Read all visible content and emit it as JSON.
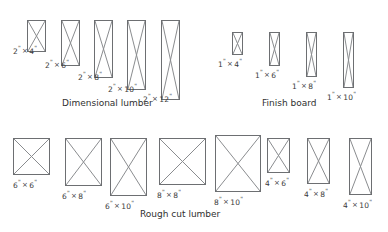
{
  "figure": {
    "background_color": "#ffffff",
    "stroke_color": "#6d6f72",
    "diagonal_color": "#8a8c8f",
    "text_color": "#3a3a3a"
  },
  "groups": [
    {
      "id": "dimensional-lumber",
      "caption": "Dimensional lumber",
      "caption_x": 62,
      "caption_y": 99,
      "items": [
        {
          "label": "2\" × 4\"",
          "nominal_width_in": 2,
          "nominal_height_in": 4,
          "shape": {
            "x": 27,
            "y": 20,
            "w": 19,
            "h": 32
          },
          "label_parts": {
            "first": "2",
            "second": "4"
          },
          "label_x": 13,
          "label_y": 45
        },
        {
          "label": "2\" × 6\"",
          "nominal_width_in": 2,
          "nominal_height_in": 6,
          "shape": {
            "x": 61,
            "y": 20,
            "w": 19,
            "h": 46
          },
          "label_parts": {
            "first": "2",
            "second": "6"
          },
          "label_x": 45,
          "label_y": 59
        },
        {
          "label": "2\" × 8\"",
          "nominal_width_in": 2,
          "nominal_height_in": 8,
          "shape": {
            "x": 94,
            "y": 20,
            "w": 19,
            "h": 58
          },
          "label_parts": {
            "first": "2",
            "second": "8"
          },
          "label_x": 78,
          "label_y": 71
        },
        {
          "label": "2\" × 10\"",
          "nominal_width_in": 2,
          "nominal_height_in": 10,
          "shape": {
            "x": 127,
            "y": 20,
            "w": 19,
            "h": 70
          },
          "label_parts": {
            "first": "2",
            "second": "10"
          },
          "label_x": 108,
          "label_y": 83
        },
        {
          "label": "2\" × 12\"",
          "nominal_width_in": 2,
          "nominal_height_in": 12,
          "shape": {
            "x": 161,
            "y": 20,
            "w": 19,
            "h": 80
          },
          "label_parts": {
            "first": "2",
            "second": "12"
          },
          "label_x": 143,
          "label_y": 93
        }
      ]
    },
    {
      "id": "finish-board",
      "caption": "Finish board",
      "caption_x": 262,
      "caption_y": 99,
      "items": [
        {
          "label": "1\" × 4\"",
          "nominal_width_in": 1,
          "nominal_height_in": 4,
          "shape": {
            "x": 232,
            "y": 32,
            "w": 11,
            "h": 23
          },
          "label_parts": {
            "first": "1",
            "second": "4"
          },
          "label_x": 218,
          "label_y": 58
        },
        {
          "label": "1\" × 6\"",
          "nominal_width_in": 1,
          "nominal_height_in": 6,
          "shape": {
            "x": 269,
            "y": 32,
            "w": 11,
            "h": 34
          },
          "label_parts": {
            "first": "1",
            "second": "6"
          },
          "label_x": 255,
          "label_y": 69
        },
        {
          "label": "1\" × 8\"",
          "nominal_width_in": 1,
          "nominal_height_in": 8,
          "shape": {
            "x": 306,
            "y": 32,
            "w": 11,
            "h": 45
          },
          "label_parts": {
            "first": "1",
            "second": "8"
          },
          "label_x": 292,
          "label_y": 80
        },
        {
          "label": "1\" × 10\"",
          "nominal_width_in": 1,
          "nominal_height_in": 10,
          "shape": {
            "x": 343,
            "y": 32,
            "w": 11,
            "h": 56
          },
          "label_parts": {
            "first": "1",
            "second": "10"
          },
          "label_x": 327,
          "label_y": 91
        }
      ]
    },
    {
      "id": "rough-cut-lumber",
      "caption": "Rough cut lumber",
      "caption_x": 140,
      "caption_y": 210,
      "items": [
        {
          "label": "6\" × 6\"",
          "nominal_width_in": 6,
          "nominal_height_in": 6,
          "shape": {
            "x": 13,
            "y": 138,
            "w": 37,
            "h": 37
          },
          "label_parts": {
            "first": "6",
            "second": "6"
          },
          "label_x": 13,
          "label_y": 179
        },
        {
          "label": "6\" × 8\"",
          "nominal_width_in": 6,
          "nominal_height_in": 8,
          "shape": {
            "x": 65,
            "y": 138,
            "w": 37,
            "h": 48
          },
          "label_parts": {
            "first": "6",
            "second": "8"
          },
          "label_x": 62,
          "label_y": 190
        },
        {
          "label": "6\" × 10\"",
          "nominal_width_in": 6,
          "nominal_height_in": 10,
          "shape": {
            "x": 110,
            "y": 138,
            "w": 37,
            "h": 58
          },
          "label_parts": {
            "first": "6",
            "second": "10"
          },
          "label_x": 105,
          "label_y": 200
        },
        {
          "label": "8\" × 8\"",
          "nominal_width_in": 8,
          "nominal_height_in": 8,
          "shape": {
            "x": 159,
            "y": 138,
            "w": 47,
            "h": 47
          },
          "label_parts": {
            "first": "8",
            "second": "8"
          },
          "label_x": 157,
          "label_y": 189
        },
        {
          "label": "8\" × 10\"",
          "nominal_width_in": 8,
          "nominal_height_in": 10,
          "shape": {
            "x": 215,
            "y": 135,
            "w": 46,
            "h": 57
          },
          "label_parts": {
            "first": "8",
            "second": "10"
          },
          "label_x": 214,
          "label_y": 196
        },
        {
          "label": "4\" × 6\"",
          "nominal_width_in": 4,
          "nominal_height_in": 6,
          "shape": {
            "x": 267,
            "y": 138,
            "w": 23,
            "h": 35
          },
          "label_parts": {
            "first": "4",
            "second": "6"
          },
          "label_x": 265,
          "label_y": 177
        },
        {
          "label": "4\" × 8\"",
          "nominal_width_in": 4,
          "nominal_height_in": 8,
          "shape": {
            "x": 307,
            "y": 138,
            "w": 23,
            "h": 46
          },
          "label_parts": {
            "first": "4",
            "second": "8"
          },
          "label_x": 304,
          "label_y": 188
        },
        {
          "label": "4\" × 10\"",
          "nominal_width_in": 4,
          "nominal_height_in": 10,
          "shape": {
            "x": 349,
            "y": 138,
            "w": 23,
            "h": 57
          },
          "label_parts": {
            "first": "4",
            "second": "10"
          },
          "label_x": 343,
          "label_y": 199
        }
      ]
    }
  ]
}
